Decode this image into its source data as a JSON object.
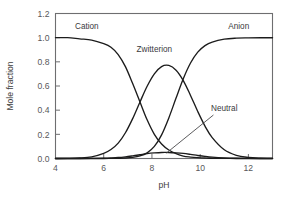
{
  "chart_data": {
    "type": "line",
    "title": "",
    "xlabel": "pH",
    "ylabel": "Mole fraction",
    "xlim": [
      4,
      13
    ],
    "ylim": [
      0.0,
      1.2
    ],
    "xticks": [
      4,
      6,
      8,
      10,
      12
    ],
    "xtick_labels": [
      "4",
      "6",
      "8",
      "10",
      "12"
    ],
    "yticks": [
      0.0,
      0.2,
      0.4,
      0.6,
      0.8,
      1.0,
      1.2
    ],
    "ytick_labels": [
      "0.0",
      "0.2",
      "0.4",
      "0.6",
      "0.8",
      "1.0",
      "1.2"
    ],
    "grid": false,
    "legend_position": "inline-annotations",
    "line_color": "#1c1c1c",
    "frame_color": "#6e6e70",
    "background": "#ffffff",
    "x": [
      4.0,
      4.5,
      5.0,
      5.5,
      6.0,
      6.3,
      6.6,
      6.9,
      7.2,
      7.5,
      7.8,
      8.1,
      8.4,
      8.7,
      9.0,
      9.3,
      9.6,
      9.9,
      10.2,
      10.5,
      11.0,
      11.5,
      12.0,
      12.5,
      13.0
    ],
    "series": [
      {
        "name": "Cation",
        "label": "Cation",
        "label_x": 5.3,
        "label_y": 1.07,
        "values": [
          1.0,
          1.0,
          0.99,
          0.98,
          0.95,
          0.92,
          0.86,
          0.76,
          0.62,
          0.47,
          0.32,
          0.2,
          0.12,
          0.07,
          0.04,
          0.02,
          0.012,
          0.007,
          0.004,
          0.002,
          0.001,
          0.0,
          0.0,
          0.0,
          0.0
        ]
      },
      {
        "name": "Zwitterion",
        "label": "Zwitterion",
        "label_x": 8.1,
        "label_y": 0.88,
        "peak_value": 0.77,
        "peak_x": 8.45,
        "values": [
          0.0,
          0.001,
          0.004,
          0.013,
          0.042,
          0.074,
          0.127,
          0.213,
          0.33,
          0.466,
          0.598,
          0.701,
          0.761,
          0.77,
          0.731,
          0.645,
          0.522,
          0.389,
          0.268,
          0.173,
          0.072,
          0.026,
          0.009,
          0.003,
          0.001
        ]
      },
      {
        "name": "Anion",
        "label": "Anion",
        "label_x": 11.6,
        "label_y": 1.07,
        "values": [
          0.0,
          0.0,
          0.0,
          0.0,
          0.0,
          0.001,
          0.002,
          0.004,
          0.009,
          0.021,
          0.047,
          0.1,
          0.196,
          0.336,
          0.5,
          0.66,
          0.79,
          0.88,
          0.934,
          0.964,
          0.988,
          0.996,
          0.998,
          0.999,
          0.999
        ]
      },
      {
        "name": "Neutral",
        "label": "Neutral",
        "label_x": 11.0,
        "label_y": 0.39,
        "peak_value": 0.05,
        "peak_x": 8.45,
        "leader_from_x": 10.55,
        "leader_from_y": 0.36,
        "leader_to_x": 8.6,
        "leader_to_y": 0.045,
        "values": [
          0.0,
          0.0,
          0.0,
          0.001,
          0.003,
          0.005,
          0.008,
          0.014,
          0.022,
          0.031,
          0.04,
          0.046,
          0.05,
          0.05,
          0.047,
          0.042,
          0.034,
          0.025,
          0.017,
          0.011,
          0.005,
          0.002,
          0.001,
          0.0,
          0.0
        ]
      }
    ]
  }
}
